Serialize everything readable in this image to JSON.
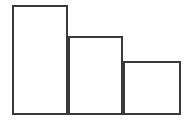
{
  "figure": {
    "name": "bar-chart-figure",
    "width": 195,
    "height": 122,
    "background_color": "#ffffff"
  },
  "style": {
    "stroke_color": "#3a3a3a",
    "fill_color": "#ffffff",
    "stroke_width": 2
  },
  "chart_data": {
    "type": "bar",
    "title": "",
    "subtitle": "",
    "xlabel": "",
    "ylabel": "",
    "categories": [
      "1",
      "2",
      "3"
    ],
    "values": [
      110,
      79,
      54
    ],
    "ylim": [
      0,
      110
    ],
    "xlim": [
      0,
      3
    ],
    "grid": false,
    "legend": false,
    "legend_position": "none",
    "tick_labels_x": [],
    "tick_labels_y": [],
    "annotations": [],
    "series": [
      {
        "name": "series-1",
        "values": [
          110,
          79,
          54
        ]
      }
    ],
    "bars": [
      {
        "name": "bar-1",
        "category": "1",
        "value": 110,
        "x": 12,
        "y": 5,
        "width": 56,
        "height": 110
      },
      {
        "name": "bar-2",
        "category": "2",
        "value": 79,
        "x": 68,
        "y": 36,
        "width": 55,
        "height": 79
      },
      {
        "name": "bar-3",
        "category": "3",
        "value": 54,
        "x": 123,
        "y": 61,
        "width": 58,
        "height": 54
      }
    ],
    "baseline_y": 115
  }
}
